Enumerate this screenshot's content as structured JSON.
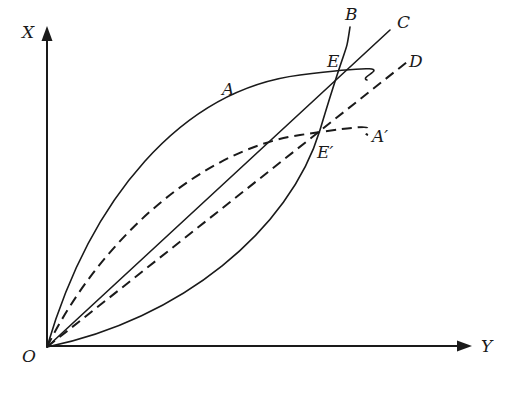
{
  "diagram": {
    "type": "economics-curve-diagram",
    "axes": {
      "vertical_label": "X",
      "horizontal_label": "Y",
      "origin_label": "O"
    },
    "curves": [
      {
        "id": "A",
        "label": "A",
        "style": "solid",
        "shape": "concave"
      },
      {
        "id": "A_prime",
        "label": "A′",
        "style": "dashed",
        "shape": "concave"
      },
      {
        "id": "B",
        "label": "B",
        "style": "solid",
        "shape": "convex"
      },
      {
        "id": "C",
        "label": "C",
        "style": "solid",
        "shape": "ray"
      },
      {
        "id": "D",
        "label": "D",
        "style": "dashed",
        "shape": "ray"
      }
    ],
    "points": [
      {
        "id": "E",
        "label": "E",
        "note": "intersection of A, B, C"
      },
      {
        "id": "E_prime",
        "label": "E′",
        "note": "intersection of A′, B, D"
      }
    ],
    "colors": {
      "ink": "#1a1a1a",
      "background": "#ffffff"
    }
  }
}
